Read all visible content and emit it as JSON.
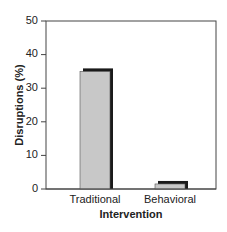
{
  "chart_data": {
    "type": "bar",
    "title": "",
    "xlabel": "Intervention",
    "ylabel": "Disruptions (%)",
    "categories": [
      "Traditional",
      "Behavioral"
    ],
    "values": [
      35,
      1.5
    ],
    "ylim": [
      0,
      50
    ],
    "yticks": [
      0,
      10,
      20,
      30,
      40,
      50
    ],
    "grid": false,
    "legend": null,
    "bar_fill": "#c8c8c8",
    "bar_shadow": "#1a1a1a"
  },
  "axis": {
    "xlabel": "Intervention",
    "ylabel": "Disruptions (%)",
    "ytick_labels": [
      "0",
      "10",
      "20",
      "30",
      "40",
      "50"
    ],
    "categories": [
      "Traditional",
      "Behavioral"
    ]
  }
}
